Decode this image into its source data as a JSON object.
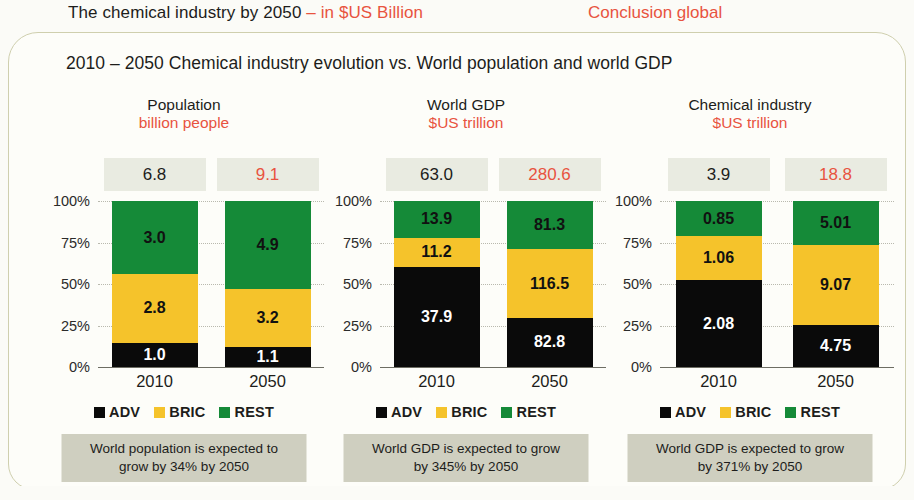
{
  "header": {
    "title_main": "The chemical industry by 2050 ",
    "title_sub": "– in $US Billion",
    "right_label": "Conclusion global"
  },
  "slide": {
    "subtitle": "2010 – 2050 Chemical industry evolution vs. World population and world GDP"
  },
  "axis": {
    "ticks": [
      "100%",
      "75%",
      "50%",
      "25%",
      "0%"
    ],
    "tick_values": [
      100,
      75,
      50,
      25,
      0
    ]
  },
  "legend": {
    "items": [
      {
        "label": "ADV",
        "color": "#0a0a0a"
      },
      {
        "label": "BRIC",
        "color": "#f5c32b"
      },
      {
        "label": "REST",
        "color": "#158a38"
      }
    ]
  },
  "colors": {
    "adv": "#0a0a0a",
    "bric": "#f5c32b",
    "rest": "#158a38",
    "accent_red": "#e8533f",
    "total_box_bg": "#e9ebe1",
    "caption_bg": "#cfcfc0",
    "frame_border": "#cfcfae",
    "page_bg": "#fbfbf7"
  },
  "chart_data": [
    {
      "type": "bar",
      "id": "population",
      "title": "Population",
      "unit": "billion people",
      "xlabel": "",
      "ylabel": "",
      "ylim": [
        0,
        100
      ],
      "stacked": true,
      "normalized_percent": true,
      "grid": true,
      "legend_position": "bottom",
      "categories": [
        "2010",
        "2050"
      ],
      "totals": [
        "6.8",
        "9.1"
      ],
      "totals_numeric": [
        6.8,
        9.1
      ],
      "series": [
        {
          "name": "ADV",
          "values": [
            1.0,
            1.1
          ],
          "labels": [
            "1.0",
            "1.1"
          ]
        },
        {
          "name": "BRIC",
          "values": [
            2.8,
            3.2
          ],
          "labels": [
            "2.8",
            "3.2"
          ]
        },
        {
          "name": "REST",
          "values": [
            3.0,
            4.9
          ],
          "labels": [
            "3.0",
            "4.9"
          ]
        }
      ],
      "caption": "World population is expected to\ngrow by 34% by 2050"
    },
    {
      "type": "bar",
      "id": "world-gdp",
      "title": "World GDP",
      "unit": "$US trillion",
      "xlabel": "",
      "ylabel": "",
      "ylim": [
        0,
        100
      ],
      "stacked": true,
      "normalized_percent": true,
      "grid": true,
      "legend_position": "bottom",
      "categories": [
        "2010",
        "2050"
      ],
      "totals": [
        "63.0",
        "280.6"
      ],
      "totals_numeric": [
        63.0,
        280.6
      ],
      "series": [
        {
          "name": "ADV",
          "values": [
            37.9,
            82.8
          ],
          "labels": [
            "37.9",
            "82.8"
          ]
        },
        {
          "name": "BRIC",
          "values": [
            11.2,
            116.5
          ],
          "labels": [
            "11.2",
            "116.5"
          ]
        },
        {
          "name": "REST",
          "values": [
            13.9,
            81.3
          ],
          "labels": [
            "13.9",
            "81.3"
          ]
        }
      ],
      "caption": "World GDP is expected to grow\nby 345% by 2050"
    },
    {
      "type": "bar",
      "id": "chemical-industry",
      "title": "Chemical industry",
      "unit": "$US trillion",
      "xlabel": "",
      "ylabel": "",
      "ylim": [
        0,
        100
      ],
      "stacked": true,
      "normalized_percent": true,
      "grid": true,
      "legend_position": "bottom",
      "categories": [
        "2010",
        "2050"
      ],
      "totals": [
        "3.9",
        "18.8"
      ],
      "totals_numeric": [
        3.9,
        18.8
      ],
      "series": [
        {
          "name": "ADV",
          "values": [
            2.08,
            4.75
          ],
          "labels": [
            "2.08",
            "4.75"
          ]
        },
        {
          "name": "BRIC",
          "values": [
            1.06,
            9.07
          ],
          "labels": [
            "1.06",
            "9.07"
          ]
        },
        {
          "name": "REST",
          "values": [
            0.85,
            5.01
          ],
          "labels": [
            "0.85",
            "5.01"
          ]
        }
      ],
      "caption": "World GDP is expected to grow\nby 371% by 2050"
    }
  ]
}
